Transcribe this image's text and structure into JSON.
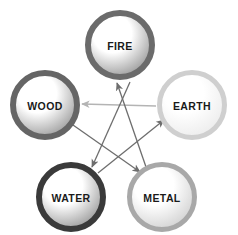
{
  "diagram": {
    "background_color": "#ffffff",
    "nodes": [
      {
        "id": "fire",
        "label": "FIRE",
        "cx": 120,
        "cy": 45,
        "r": 35,
        "ring_color": "#6b6b6b",
        "ring_width": 6,
        "fill_light": "#ffffff",
        "fill_dark": "#9a9a9a",
        "font_size": 10.5
      },
      {
        "id": "wood",
        "label": "WOOD",
        "cx": 45,
        "cy": 105,
        "r": 35,
        "ring_color": "#656565",
        "ring_width": 6,
        "fill_light": "#ffffff",
        "fill_dark": "#9d9d9d",
        "font_size": 10.5
      },
      {
        "id": "earth",
        "label": "EARTH",
        "cx": 192,
        "cy": 105,
        "r": 35,
        "ring_color": "#cfcfcf",
        "ring_width": 5,
        "fill_light": "#ffffff",
        "fill_dark": "#ececec",
        "font_size": 10.5
      },
      {
        "id": "water",
        "label": "WATER",
        "cx": 71,
        "cy": 197,
        "r": 35,
        "ring_color": "#3a3a3a",
        "ring_width": 6,
        "fill_light": "#ffffff",
        "fill_dark": "#9a9a9a",
        "font_size": 10.5
      },
      {
        "id": "metal",
        "label": "METAL",
        "cx": 162,
        "cy": 197,
        "r": 35,
        "ring_color": "#a8a8a8",
        "ring_width": 5,
        "fill_light": "#ffffff",
        "fill_dark": "#d2d2d2",
        "font_size": 10.5
      }
    ],
    "arrows": [
      {
        "id": "earth-to-wood",
        "from": "earth",
        "to": "wood",
        "x1": 156,
        "y1": 106,
        "x2": 82,
        "y2": 104,
        "color": "#b4b4b4",
        "width": 1.3
      },
      {
        "id": "wood-to-metal",
        "from": "wood",
        "to": "metal",
        "x1": 73,
        "y1": 125,
        "x2": 140,
        "y2": 172,
        "color": "#6e6e6e",
        "width": 1.3
      },
      {
        "id": "metal-to-fire",
        "from": "metal",
        "to": "fire",
        "x1": 146,
        "y1": 167,
        "x2": 117,
        "y2": 83,
        "color": "#6e6e6e",
        "width": 1.3
      },
      {
        "id": "fire-to-water",
        "from": "fire",
        "to": "water",
        "x1": 130,
        "y1": 82,
        "x2": 92,
        "y2": 167,
        "color": "#6e6e6e",
        "width": 1.3
      },
      {
        "id": "water-to-earth",
        "from": "water",
        "to": "earth",
        "x1": 98,
        "y1": 173,
        "x2": 164,
        "y2": 120,
        "color": "#6e6e6e",
        "width": 1.3
      }
    ]
  }
}
